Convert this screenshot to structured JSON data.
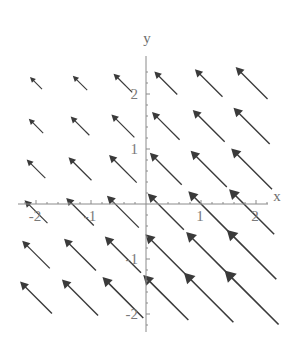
{
  "figure": {
    "background_color": "#ffffff",
    "axis_color": "#8a8a8a",
    "arrow_color": "#3a3a3a",
    "label_color": "#7a7a7a",
    "width": 298,
    "height": 342
  },
  "axes": {
    "x_label": "x",
    "y_label": "y",
    "x_ticks": [
      {
        "value": -2,
        "label": "-2"
      },
      {
        "value": -1,
        "label": "-1"
      },
      {
        "value": 1,
        "label": "1"
      },
      {
        "value": 2,
        "label": "2"
      }
    ],
    "y_ticks": [
      {
        "value": -2,
        "label": "-2"
      },
      {
        "value": -1,
        "label": "-1"
      },
      {
        "value": 1,
        "label": "1"
      },
      {
        "value": 2,
        "label": "2"
      }
    ]
  },
  "chart_data": {
    "type": "scatter",
    "plot_kind": "vector-field",
    "title": "",
    "xlabel": "x",
    "ylabel": "y",
    "xlim": [
      -2.45,
      2.45
    ],
    "ylim": [
      -2.35,
      2.5
    ],
    "grid": false,
    "legend": null,
    "arrow_direction_deg": 135,
    "vectors": [
      {
        "x": -2.0,
        "y": 2.2,
        "u": -0.22,
        "v": 0.22,
        "length": 0.31
      },
      {
        "x": -1.2,
        "y": 2.2,
        "u": -0.26,
        "v": 0.26,
        "length": 0.37
      },
      {
        "x": -0.42,
        "y": 2.2,
        "u": -0.34,
        "v": 0.34,
        "length": 0.48
      },
      {
        "x": 0.36,
        "y": 2.2,
        "u": -0.42,
        "v": 0.42,
        "length": 0.59
      },
      {
        "x": 1.14,
        "y": 2.2,
        "u": -0.5,
        "v": 0.5,
        "length": 0.71
      },
      {
        "x": 1.92,
        "y": 2.2,
        "u": -0.58,
        "v": 0.58,
        "length": 0.82
      },
      {
        "x": -2.0,
        "y": 1.42,
        "u": -0.26,
        "v": 0.26,
        "length": 0.37
      },
      {
        "x": -1.2,
        "y": 1.42,
        "u": -0.34,
        "v": 0.34,
        "length": 0.48
      },
      {
        "x": -0.42,
        "y": 1.42,
        "u": -0.42,
        "v": 0.42,
        "length": 0.59
      },
      {
        "x": 0.36,
        "y": 1.42,
        "u": -0.5,
        "v": 0.5,
        "length": 0.71
      },
      {
        "x": 1.14,
        "y": 1.42,
        "u": -0.58,
        "v": 0.58,
        "length": 0.82
      },
      {
        "x": 1.92,
        "y": 1.42,
        "u": -0.66,
        "v": 0.66,
        "length": 0.93
      },
      {
        "x": -2.0,
        "y": 0.64,
        "u": -0.34,
        "v": 0.34,
        "length": 0.48
      },
      {
        "x": -1.2,
        "y": 0.64,
        "u": -0.42,
        "v": 0.42,
        "length": 0.59
      },
      {
        "x": -0.42,
        "y": 0.64,
        "u": -0.5,
        "v": 0.5,
        "length": 0.71
      },
      {
        "x": 0.36,
        "y": 0.64,
        "u": -0.58,
        "v": 0.58,
        "length": 0.82
      },
      {
        "x": 1.14,
        "y": 0.64,
        "u": -0.66,
        "v": 0.66,
        "length": 0.93
      },
      {
        "x": 1.92,
        "y": 0.64,
        "u": -0.74,
        "v": 0.74,
        "length": 1.05
      },
      {
        "x": -2.0,
        "y": -0.14,
        "u": -0.42,
        "v": 0.42,
        "length": 0.59
      },
      {
        "x": -1.2,
        "y": -0.14,
        "u": -0.5,
        "v": 0.5,
        "length": 0.71
      },
      {
        "x": -0.42,
        "y": -0.14,
        "u": -0.58,
        "v": 0.58,
        "length": 0.82
      },
      {
        "x": 0.36,
        "y": -0.14,
        "u": -0.66,
        "v": 0.66,
        "length": 0.93
      },
      {
        "x": 1.14,
        "y": -0.14,
        "u": -0.74,
        "v": 0.74,
        "length": 1.05
      },
      {
        "x": 1.92,
        "y": -0.14,
        "u": -0.82,
        "v": 0.82,
        "length": 1.16
      },
      {
        "x": -2.0,
        "y": -0.92,
        "u": -0.5,
        "v": 0.5,
        "length": 0.71
      },
      {
        "x": -1.2,
        "y": -0.92,
        "u": -0.58,
        "v": 0.58,
        "length": 0.82
      },
      {
        "x": -0.42,
        "y": -0.92,
        "u": -0.66,
        "v": 0.66,
        "length": 0.93
      },
      {
        "x": 0.36,
        "y": -0.92,
        "u": -0.74,
        "v": 0.74,
        "length": 1.05
      },
      {
        "x": 1.14,
        "y": -0.92,
        "u": -0.82,
        "v": 0.82,
        "length": 1.16
      },
      {
        "x": 1.92,
        "y": -0.92,
        "u": -0.9,
        "v": 0.9,
        "length": 1.27
      },
      {
        "x": -2.0,
        "y": -1.7,
        "u": -0.58,
        "v": 0.58,
        "length": 0.82
      },
      {
        "x": -1.2,
        "y": -1.7,
        "u": -0.66,
        "v": 0.66,
        "length": 0.93
      },
      {
        "x": -0.42,
        "y": -1.7,
        "u": -0.74,
        "v": 0.74,
        "length": 1.05
      },
      {
        "x": 0.36,
        "y": -1.7,
        "u": -0.82,
        "v": 0.82,
        "length": 1.16
      },
      {
        "x": 1.14,
        "y": -1.7,
        "u": -0.9,
        "v": 0.9,
        "length": 1.27
      },
      {
        "x": 1.92,
        "y": -1.7,
        "u": -0.98,
        "v": 0.98,
        "length": 1.39
      }
    ]
  }
}
